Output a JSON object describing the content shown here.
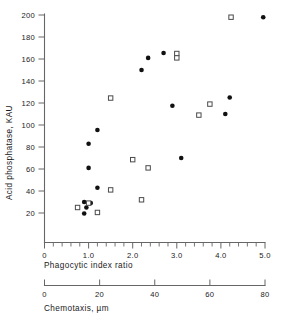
{
  "chart_data": {
    "type": "scatter",
    "title": "",
    "xlabel": "Phagocytic index ratio",
    "ylabel": "Acid phosphatase, KAU",
    "secondary_xlabel": "Chemotaxis, µm",
    "xlim": [
      0,
      5.0
    ],
    "ylim": [
      0,
      200
    ],
    "secondary_xlim": [
      0,
      80
    ],
    "grid": false,
    "legend": "none",
    "xticks": [
      "0",
      "1.0",
      "2.0",
      "3.0",
      "4.0",
      "5.0"
    ],
    "xtick_values": [
      0,
      1.0,
      2.0,
      3.0,
      4.0,
      5.0
    ],
    "x_minor_interval": 0.2,
    "yticks": [
      "20",
      "40",
      "60",
      "80",
      "100",
      "120",
      "140",
      "160",
      "180",
      "200"
    ],
    "ytick_values": [
      20,
      40,
      60,
      80,
      100,
      120,
      140,
      160,
      180,
      200
    ],
    "secondary_xticks": [
      "0",
      "20",
      "40",
      "60",
      "80"
    ],
    "secondary_xtick_values": [
      0,
      20,
      40,
      60,
      80
    ],
    "series": [
      {
        "name": "filled-circles",
        "marker": "filled-circle",
        "color": "#111111",
        "points": [
          [
            0.9,
            19.5
          ],
          [
            0.95,
            25.0
          ],
          [
            0.9,
            30.0
          ],
          [
            1.05,
            29.0
          ],
          [
            1.2,
            43.0
          ],
          [
            1.0,
            61.0
          ],
          [
            1.0,
            83.0
          ],
          [
            1.2,
            95.5
          ],
          [
            2.2,
            150.0
          ],
          [
            2.35,
            161.0
          ],
          [
            2.7,
            165.5
          ],
          [
            2.9,
            117.5
          ],
          [
            3.1,
            70.0
          ],
          [
            4.1,
            110.0
          ],
          [
            4.2,
            125.0
          ],
          [
            4.96,
            198.0
          ]
        ]
      },
      {
        "name": "open-squares",
        "marker": "open-square",
        "color": "#4a4a4a",
        "points": [
          [
            0.75,
            25.0
          ],
          [
            1.0,
            29.0
          ],
          [
            1.2,
            20.5
          ],
          [
            1.5,
            41.0
          ],
          [
            1.5,
            124.5
          ],
          [
            2.0,
            68.5
          ],
          [
            2.2,
            32.0
          ],
          [
            2.35,
            61.0
          ],
          [
            3.0,
            165.0
          ],
          [
            3.0,
            161.0
          ],
          [
            3.5,
            109.0
          ],
          [
            3.75,
            119.0
          ],
          [
            4.23,
            198.0
          ]
        ]
      }
    ]
  },
  "figure": {
    "axis_color": "#666666",
    "text_color": "#1a1a1a",
    "background": "#ffffff"
  }
}
